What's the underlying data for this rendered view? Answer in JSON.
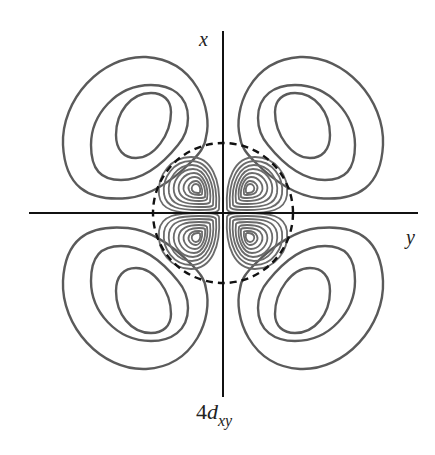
{
  "figure": {
    "caption": {
      "prefix": "4",
      "letter": "d",
      "subscript": "xy"
    },
    "axes": {
      "vertical_label": "x",
      "horizontal_label": "y"
    },
    "colors": {
      "axis": "#111111",
      "outer_contours": "#5a5a5a",
      "inner_contours": "#6a6a6a",
      "node_circle": "#111111",
      "background": "#ffffff"
    },
    "elements": {
      "outer_lobes": 4,
      "outer_contours_per_lobe": 3,
      "inner_lobes": 4,
      "inner_contours_per_lobe": 9,
      "radial_node": "dashed circle"
    }
  }
}
